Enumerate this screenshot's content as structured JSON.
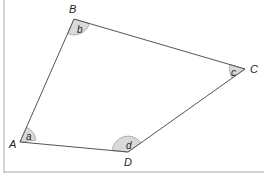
{
  "diagram": {
    "type": "quadrilateral",
    "vertices": [
      {
        "name": "A",
        "x": 20,
        "y": 142,
        "label_x": 9,
        "label_y": 148,
        "angle_label": "a",
        "angle_label_x": 27,
        "angle_label_y": 136
      },
      {
        "name": "B",
        "x": 74,
        "y": 19,
        "label_x": 69,
        "label_y": 13,
        "angle_label": "b",
        "angle_label_x": 77,
        "angle_label_y": 32
      },
      {
        "name": "C",
        "x": 245,
        "y": 69,
        "label_x": 250,
        "label_y": 72,
        "angle_label": "c",
        "angle_label_x": 230,
        "angle_label_y": 76
      },
      {
        "name": "D",
        "x": 128,
        "y": 152,
        "label_x": 128,
        "label_y": 166,
        "angle_label": "d",
        "angle_label_x": 128,
        "angle_label_y": 147
      }
    ],
    "angle_fill": "#d9d9d9",
    "line_color": "#555555",
    "border_color": "#aaaaaa"
  }
}
